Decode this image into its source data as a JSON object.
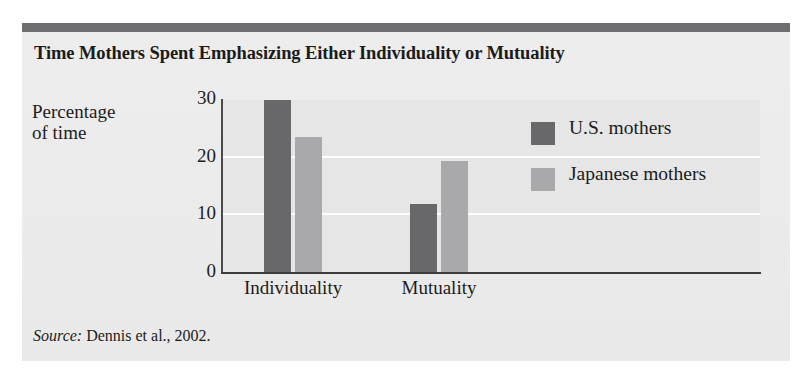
{
  "figure": {
    "title": "Time Mothers Spent Emphasizing Either Individuality or Mutuality",
    "source_prefix": "Source:",
    "source_text": "Dennis et al., 2002.",
    "colors": {
      "header_bar": "#6e6e70",
      "card_background": "#ececec",
      "plot_background": "#e6e6e6",
      "gridline": "#fdfdfd",
      "axis": "#3d3d3f",
      "series_us": "#68686a",
      "series_japan": "#a9a9ab",
      "text": "#1b1b1b"
    }
  },
  "chart_data": {
    "type": "bar",
    "title": "Time Mothers Spent Emphasizing Either Individuality or Mutuality",
    "categories": [
      "Individuality",
      "Mutuality"
    ],
    "series": [
      {
        "name": "U.S. mothers",
        "color": "#68686a",
        "values": [
          30,
          12
        ]
      },
      {
        "name": "Japanese mothers",
        "color": "#a9a9ab",
        "values": [
          23.5,
          19.5
        ]
      }
    ],
    "xlabel": "",
    "ylabel": "Percentage of time",
    "ylabel_lines": [
      "Percentage",
      "of time"
    ],
    "ylim": [
      0,
      30
    ],
    "yticks": [
      0,
      10,
      20,
      30
    ],
    "ytick_labels": [
      "0",
      "10",
      "20",
      "30"
    ],
    "grid": true,
    "grid_axis": "y",
    "legend_position": "inside-right",
    "annotations": [],
    "source": "Source: Dennis et al., 2002."
  }
}
